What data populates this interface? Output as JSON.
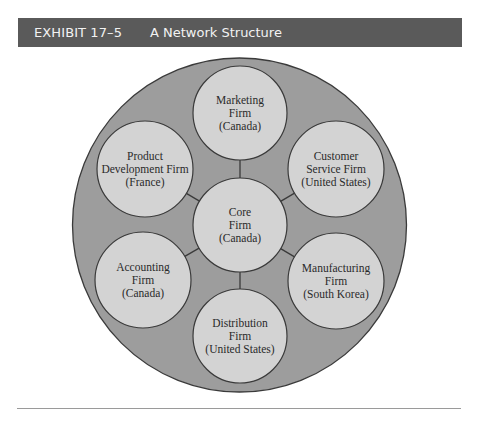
{
  "exhibit": {
    "number": "EXHIBIT 17–5",
    "title": "A Network Structure"
  },
  "colors": {
    "header_bg": "#5a5a5a",
    "header_text": "#f2f2f2",
    "outer_circle_fill": "#9d9d9d",
    "node_fill": "#d3d3d3",
    "stroke": "#3a3a3a",
    "rule": "#9a9a9a"
  },
  "diagram": {
    "type": "network-hub",
    "outer_circle": {
      "cx": 239.5,
      "cy": 225,
      "r": 167
    },
    "center_node": {
      "id": "core",
      "lines": [
        "Core",
        "Firm",
        "(Canada)"
      ],
      "cx": 240,
      "cy": 225,
      "r": 47
    },
    "nodes": [
      {
        "id": "marketing",
        "lines": [
          "Marketing",
          "Firm",
          "(Canada)"
        ],
        "cx": 240,
        "cy": 113,
        "r": 47
      },
      {
        "id": "customer-service",
        "lines": [
          "Customer",
          "Service Firm",
          "(United States)"
        ],
        "cx": 336,
        "cy": 169,
        "r": 48
      },
      {
        "id": "manufacturing",
        "lines": [
          "Manufacturing",
          "Firm",
          "(South Korea)"
        ],
        "cx": 336,
        "cy": 281,
        "r": 48
      },
      {
        "id": "distribution",
        "lines": [
          "Distribution",
          "Firm",
          "(United States)"
        ],
        "cx": 240,
        "cy": 336,
        "r": 47
      },
      {
        "id": "accounting",
        "lines": [
          "Accounting",
          "Firm",
          "(Canada)"
        ],
        "cx": 143,
        "cy": 280,
        "r": 48
      },
      {
        "id": "product-development",
        "lines": [
          "Product",
          "Development Firm",
          "(France)"
        ],
        "cx": 145,
        "cy": 169,
        "r": 48
      }
    ]
  }
}
